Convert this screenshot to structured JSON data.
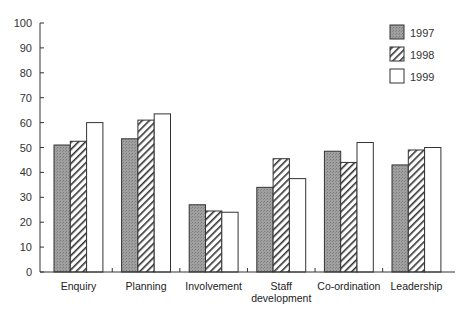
{
  "chart_data": {
    "type": "bar",
    "title": "",
    "xlabel": "",
    "ylabel": "",
    "ylim": [
      0,
      100
    ],
    "yticks": [
      0,
      10,
      20,
      30,
      40,
      50,
      60,
      70,
      80,
      90,
      100
    ],
    "grid": false,
    "legend_position": "top-right",
    "categories": [
      "Enquiry",
      "Planning",
      "Involvement",
      "Staff development",
      "Co-ordination",
      "Leadership"
    ],
    "category_label_lines": [
      [
        "Enquiry"
      ],
      [
        "Planning"
      ],
      [
        "Involvement"
      ],
      [
        "Staff",
        "development"
      ],
      [
        "Co-ordination"
      ],
      [
        "Leadership"
      ]
    ],
    "series": [
      {
        "name": "1997",
        "fill": "gray-stipple",
        "values": [
          51,
          53.5,
          27,
          34,
          48.5,
          43
        ]
      },
      {
        "name": "1998",
        "fill": "diagonal-hatch",
        "values": [
          52.5,
          61,
          24.5,
          45.5,
          44,
          49
        ]
      },
      {
        "name": "1999",
        "fill": "white",
        "values": [
          60,
          63.5,
          24,
          37.5,
          52,
          50
        ]
      }
    ]
  },
  "colors": {
    "axis": "#333333",
    "series_1997": "#9a9a9a",
    "series_1998_hatch": "#333333",
    "series_1999": "#ffffff"
  }
}
